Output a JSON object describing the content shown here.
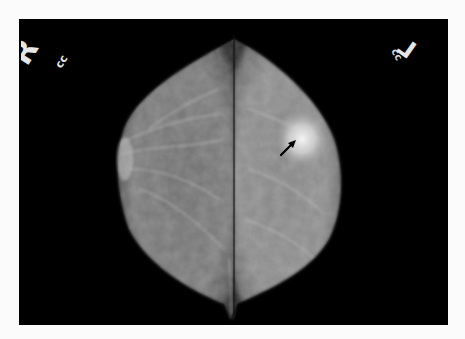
{
  "image": {
    "type": "mammogram",
    "view": "CC",
    "views": [
      {
        "side": "R",
        "projection": "cc",
        "position": "left half"
      },
      {
        "side": "L",
        "projection": "cc",
        "position": "right half"
      }
    ],
    "annotation": {
      "type": "arrow",
      "target": "dense mass, upper-outer left breast",
      "arrow_color": "#000000"
    }
  },
  "labels": {
    "right_side": "R",
    "right_proj": "cc",
    "left_side": "L",
    "left_proj": "cc"
  },
  "colors": {
    "page_bg": "#fbfbfb",
    "film_bg": "#000000",
    "tissue": "#8a8a8a",
    "label": "#e8e8e8"
  }
}
